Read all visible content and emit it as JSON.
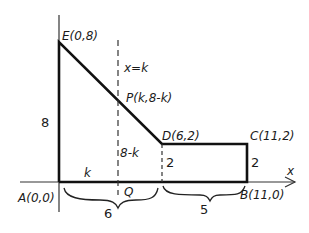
{
  "diagram": {
    "points": {
      "E": "E(0,8)",
      "D": "D(6,2)",
      "C": "C(11,2)",
      "B": "B(11,0)",
      "A": "A(0,0)",
      "P": "P(k,8-k)",
      "Q": "Q"
    },
    "line_label": "x=k",
    "axis_label": "x",
    "dimensions": {
      "height_AE": "8",
      "seg_k": "k",
      "seg_8k": "8-k",
      "seg_D_height": "2",
      "seg_C_height": "2",
      "brace_AQ_D": "6",
      "brace_DB": "5"
    }
  }
}
